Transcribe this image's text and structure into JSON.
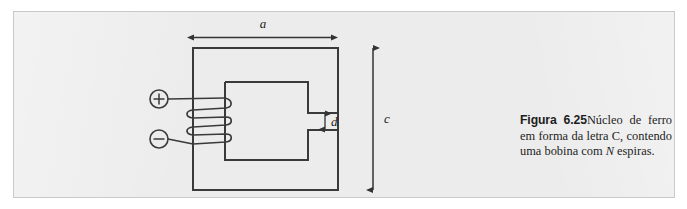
{
  "figure": {
    "panel_background": "#ececec",
    "line_color": "#3a3a3a",
    "caption": {
      "label": "Figura 6.25",
      "text_part_1": "Núcleo de ferro em forma da letra C, contendo uma bobina com ",
      "italic_symbol": "N",
      "text_part_2": " espiras."
    },
    "diagram": {
      "title": "iron C-core with N-turn coil",
      "dimension_labels": [
        {
          "name": "a",
          "text": "a",
          "meaning": "core outer width",
          "x": 263,
          "y": 28
        },
        {
          "name": "c",
          "text": "c",
          "meaning": "core outer height",
          "x": 384,
          "y": 122
        },
        {
          "name": "d",
          "text": "d",
          "meaning": "air gap height",
          "x": 338,
          "y": 120
        }
      ],
      "terminals": [
        {
          "name": "positive",
          "glyph": "+",
          "cx": 159,
          "cy": 99,
          "r": 9
        },
        {
          "name": "negative",
          "glyph": "−",
          "cx": 159,
          "cy": 139,
          "r": 9
        }
      ],
      "coil": {
        "turns": 3,
        "label": "N"
      },
      "core": {
        "outer": {
          "x": 193,
          "y": 48,
          "width": 145,
          "height": 142
        },
        "inner": {
          "x": 225,
          "y": 82,
          "width": 83,
          "height": 78
        },
        "gap": {
          "x": 308,
          "y": 113,
          "width": 30,
          "height": 17
        }
      }
    }
  }
}
